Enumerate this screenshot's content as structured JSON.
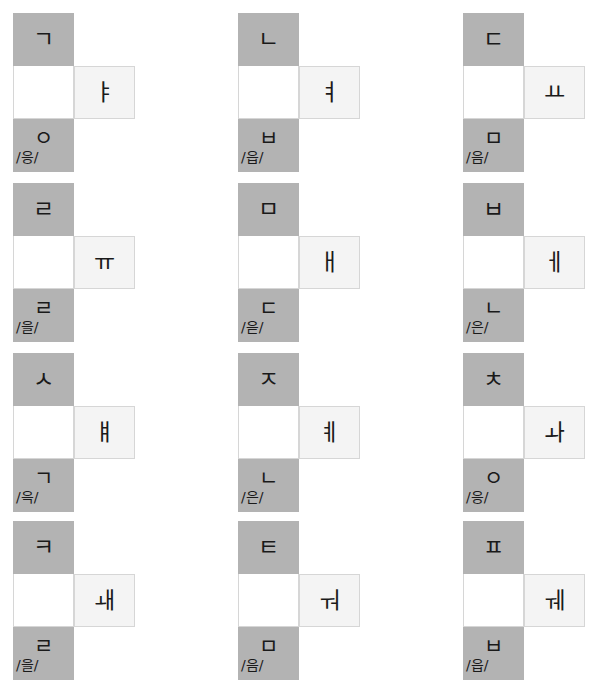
{
  "layout": {
    "columns": 3,
    "rows": 4,
    "column_x": [
      0,
      225,
      450
    ],
    "row_y": [
      13,
      183,
      353,
      521
    ],
    "colors": {
      "consonant_cell": "#b3b3b3",
      "vowel_cell": "#f4f4f4",
      "blank_cell": "#ffffff",
      "cell_border": "#d6d6d6",
      "text": "#1a1a1a",
      "page_background": "#ffffff"
    }
  },
  "blocks": [
    {
      "index": 1,
      "initial_consonant": "ㄱ",
      "vowel": "ㅑ",
      "final_consonant": "ㅇ",
      "romanization": "/응/"
    },
    {
      "index": 2,
      "initial_consonant": "ㄴ",
      "vowel": "ㅕ",
      "final_consonant": "ㅂ",
      "romanization": "/읍/"
    },
    {
      "index": 3,
      "initial_consonant": "ㄷ",
      "vowel": "ㅛ",
      "final_consonant": "ㅁ",
      "romanization": "/음/"
    },
    {
      "index": 4,
      "initial_consonant": "ㄹ",
      "vowel": "ㅠ",
      "final_consonant": "ㄹ",
      "romanization": "/을/"
    },
    {
      "index": 5,
      "initial_consonant": "ㅁ",
      "vowel": "ㅐ",
      "final_consonant": "ㄷ",
      "romanization": "/읃/"
    },
    {
      "index": 6,
      "initial_consonant": "ㅂ",
      "vowel": "ㅔ",
      "final_consonant": "ㄴ",
      "romanization": "/은/"
    },
    {
      "index": 7,
      "initial_consonant": "ㅅ",
      "vowel": "ㅒ",
      "final_consonant": "ㄱ",
      "romanization": "/윽/"
    },
    {
      "index": 8,
      "initial_consonant": "ㅈ",
      "vowel": "ㅖ",
      "final_consonant": "ㄴ",
      "romanization": "/은/"
    },
    {
      "index": 9,
      "initial_consonant": "ㅊ",
      "vowel": "ㅘ",
      "final_consonant": "ㅇ",
      "romanization": "/응/"
    },
    {
      "index": 10,
      "initial_consonant": "ㅋ",
      "vowel": "ㅙ",
      "final_consonant": "ㄹ",
      "romanization": "/을/"
    },
    {
      "index": 11,
      "initial_consonant": "ㅌ",
      "vowel": "ㅝ",
      "final_consonant": "ㅁ",
      "romanization": "/음/"
    },
    {
      "index": 12,
      "initial_consonant": "ㅍ",
      "vowel": "ㅞ",
      "final_consonant": "ㅂ",
      "romanization": "/읍/"
    }
  ]
}
